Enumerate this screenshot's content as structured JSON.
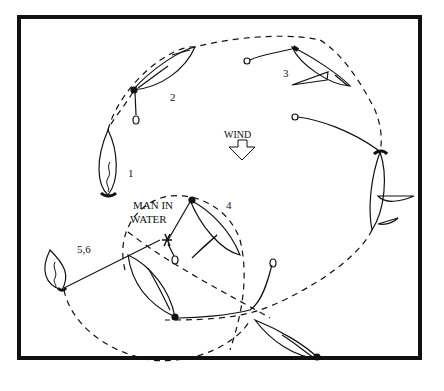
{
  "diagram": {
    "wind_label": "WIND",
    "man_label_line1": "MAN IN",
    "man_label_line2": "WATER",
    "positions": [
      {
        "id": "1",
        "label": "1"
      },
      {
        "id": "2",
        "label": "2"
      },
      {
        "id": "3",
        "label": "3"
      },
      {
        "id": "4",
        "label": "4"
      },
      {
        "id": "56",
        "label": "5,6"
      }
    ],
    "colors": {
      "ink": "#111111",
      "paper": "#ffffff",
      "frame": "#111111"
    }
  }
}
